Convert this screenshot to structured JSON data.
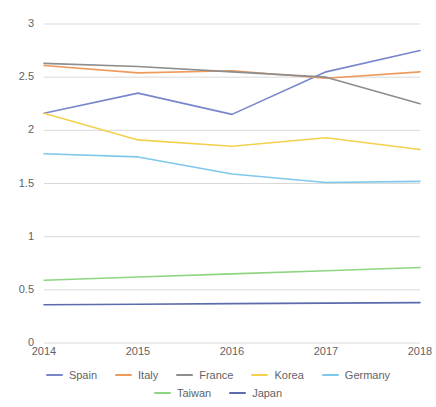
{
  "chart_data": {
    "type": "line",
    "title": "",
    "xlabel": "",
    "ylabel": "",
    "categories": [
      "2014",
      "2015",
      "2016",
      "2017",
      "2018"
    ],
    "x": [
      2014,
      2015,
      2016,
      2017,
      2018
    ],
    "ylim": [
      0,
      3
    ],
    "y_ticks": [
      "0",
      "0.5",
      "1",
      "1.5",
      "2",
      "2.5",
      "3"
    ],
    "y_tick_values": [
      0,
      0.5,
      1,
      1.5,
      2,
      2.5,
      3
    ],
    "grid": true,
    "legend_position": "bottom",
    "series": [
      {
        "name": "Spain",
        "color": "#7986cb",
        "values": [
          2.16,
          2.35,
          2.15,
          2.55,
          2.75
        ]
      },
      {
        "name": "Italy",
        "color": "#ef9a5d",
        "values": [
          2.61,
          2.54,
          2.56,
          2.49,
          2.55
        ]
      },
      {
        "name": "France",
        "color": "#8d8d8d",
        "values": [
          2.63,
          2.6,
          2.55,
          2.5,
          2.25
        ]
      },
      {
        "name": "Korea",
        "color": "#f2d14e",
        "values": [
          2.16,
          1.91,
          1.85,
          1.93,
          1.82
        ]
      },
      {
        "name": "Germany",
        "color": "#7ec8ea",
        "values": [
          1.78,
          1.75,
          1.59,
          1.51,
          1.52
        ]
      },
      {
        "name": "Taiwan",
        "color": "#8ed581",
        "values": [
          0.59,
          0.62,
          0.65,
          0.68,
          0.71
        ]
      },
      {
        "name": "Japan",
        "color": "#5c6bab",
        "values": [
          0.36,
          0.365,
          0.37,
          0.375,
          0.38
        ]
      }
    ]
  },
  "axis": {
    "y_labels": [
      "3",
      "2.5",
      "2",
      "1.5",
      "1",
      "0.5",
      "0"
    ],
    "x_labels": [
      "2014",
      "2015",
      "2016",
      "2017",
      "2018"
    ]
  },
  "legend": {
    "row1": [
      "Spain",
      "Italy",
      "France",
      "Korea",
      "Germany"
    ],
    "row2": [
      "Taiwan",
      "Japan"
    ]
  },
  "colors": {
    "grid": "#d9d9d9",
    "axis_text": "#5f6368",
    "background": "#ffffff"
  }
}
